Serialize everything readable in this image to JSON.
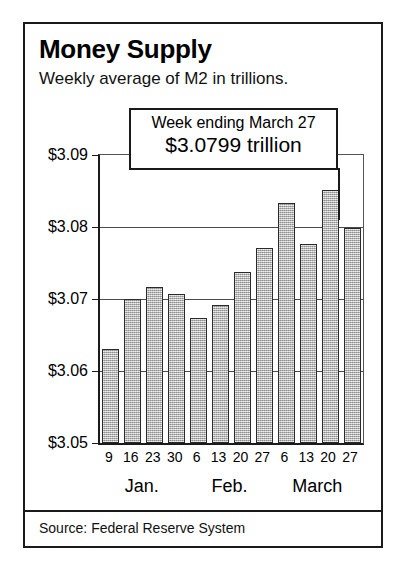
{
  "figure": {
    "title": "Money Supply",
    "subtitle": "Weekly average of M2 in trillions.",
    "source": "Source: Federal Reserve System"
  },
  "callout": {
    "line1": "Week ending March 27",
    "line2": "$3.0799 trillion"
  },
  "axis": {
    "y_labels": [
      "$3.09",
      "$3.08",
      "$3.07",
      "$3.06",
      "$3.05"
    ],
    "x_labels": [
      "9",
      "16",
      "23",
      "30",
      "6",
      "13",
      "20",
      "27",
      "6",
      "13",
      "20",
      "27"
    ],
    "month_labels": [
      "Jan.",
      "Feb.",
      "March"
    ]
  },
  "colors": {
    "bar_fill": "#b4b4b4",
    "bar_stroke": "#2a2a2a",
    "frame": "#1a1a1a",
    "grid": "#4a4a4a",
    "background": "#ffffff"
  },
  "chart_data": {
    "type": "bar",
    "title": "Money Supply",
    "subtitle": "Weekly average of M2 in trillions.",
    "xlabel": "",
    "ylabel": "",
    "ylim": [
      3.05,
      3.09
    ],
    "yticks": [
      3.05,
      3.06,
      3.07,
      3.08,
      3.09
    ],
    "ytick_labels": [
      "$3.05",
      "$3.06",
      "$3.07",
      "$3.08",
      "$3.09"
    ],
    "grid": true,
    "legend": false,
    "units": "trillions of dollars",
    "categories": [
      "9",
      "16",
      "23",
      "30",
      "6",
      "13",
      "20",
      "27",
      "6",
      "13",
      "20",
      "27"
    ],
    "category_groups": [
      {
        "label": "Jan.",
        "categories": [
          "9",
          "16",
          "23",
          "30"
        ]
      },
      {
        "label": "Feb.",
        "categories": [
          "6",
          "13",
          "20",
          "27"
        ]
      },
      {
        "label": "March",
        "categories": [
          "6",
          "13",
          "20",
          "27"
        ]
      }
    ],
    "values": [
      3.0631,
      3.07,
      3.0716,
      3.0707,
      3.0674,
      3.0691,
      3.0738,
      3.0771,
      3.0833,
      3.0777,
      3.0852,
      3.0799
    ],
    "annotations": [
      {
        "text": "Week ending March 27",
        "value": 3.0799,
        "category": "27",
        "group": "March"
      },
      {
        "text": "$3.0799 trillion",
        "value": 3.0799,
        "category": "27",
        "group": "March"
      }
    ],
    "source": "Source: Federal Reserve System"
  }
}
